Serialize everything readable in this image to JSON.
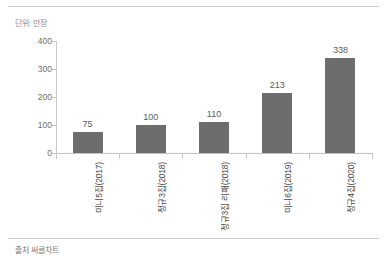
{
  "figure": {
    "unit_label": "단위: 만장",
    "source_label": "출처 써클차트"
  },
  "chart_data": {
    "type": "bar",
    "title": "",
    "subtitle": "",
    "xlabel": "",
    "ylabel": "단위: 만장",
    "categories": [
      "미니5집(2017)",
      "정규3집(2018)",
      "정규3집 리패(2018)",
      "미니6집(2019)",
      "정규4집(2020)"
    ],
    "values": [
      75,
      100,
      110,
      213,
      338
    ],
    "value_labels": [
      "75",
      "100",
      "110",
      "213",
      "338"
    ],
    "ylim": [
      0,
      400
    ],
    "yticks": [
      0,
      100,
      200,
      300,
      400
    ],
    "ytick_labels": [
      "0",
      "100",
      "200",
      "300",
      "400"
    ],
    "grid": false,
    "legend": null,
    "bar_color": "#6d6d6d",
    "axis_color": "#c2c2c2",
    "text_color": "#5a5a5a",
    "source": "출처 써클차트"
  }
}
